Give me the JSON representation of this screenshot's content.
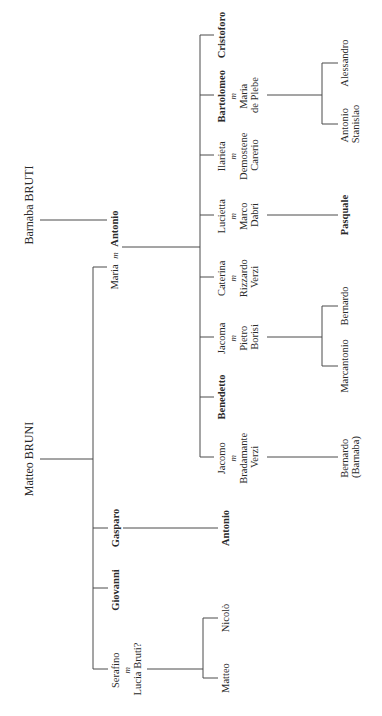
{
  "diagram": {
    "type": "family-tree",
    "orientation": "rotated-90-ccw",
    "marriage_symbol": "m",
    "roots": [
      {
        "name": "Barnaba BRUTI"
      },
      {
        "name": "Matteo BRUNI"
      }
    ],
    "generation_1": {
      "maria_antonio": {
        "left": "Maria",
        "symbol": "m",
        "right": "Antonio",
        "right_bold": true
      },
      "gasparo": "Gasparo",
      "giovanni": "Giovanni",
      "serafino": {
        "line1": "Serafino",
        "symbol": "m",
        "line2": "Lucia Bruti?"
      }
    },
    "generation_2": {
      "cristoforo": "Cristoforo",
      "bartolomeo": {
        "line1": "Bartolomeo",
        "symbol": "m",
        "line2": "Maria",
        "line3": "de Plebe"
      },
      "ilarieta": {
        "line1": "Ilarieta",
        "symbol": "m",
        "line2": "Demostene",
        "line3": "Carerio"
      },
      "lucietta": {
        "line1": "Lucietta",
        "symbol": "m",
        "line2": "Marco",
        "line3": "Dabri"
      },
      "caterina": {
        "line1": "Caterina",
        "symbol": "m",
        "line2": "Rizzardo",
        "line3": "Verzi"
      },
      "jacoma": {
        "line1": "Jacoma",
        "symbol": "m",
        "line2": "Pietro",
        "line3": "Borisi"
      },
      "benedetto": "Benedetto",
      "jacomo": {
        "line1": "Jacomo",
        "symbol": "m",
        "line2": "Bradamante",
        "line3": "Verzi"
      },
      "antonio": "Antonio",
      "nicolo": "Nicolò",
      "matteo": "Matteo"
    },
    "generation_3": {
      "alessandro": "Alessandro",
      "antonio_stanislao": {
        "line1": "Antonio",
        "line2": "Stanislao"
      },
      "pasquale": "Pasquale",
      "bernardo": "Bernardo",
      "marcantonio": "Marcantonio",
      "bernardo_barnaba": {
        "line1": "Bernardo",
        "line2": "(Barnaba)"
      }
    }
  }
}
